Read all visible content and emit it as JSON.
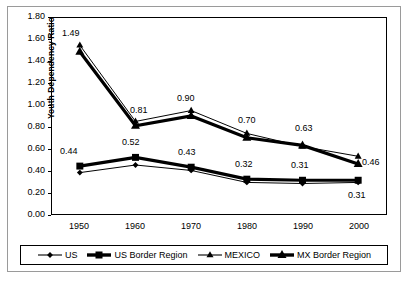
{
  "chart_data": {
    "type": "line",
    "title": "",
    "xlabel": "",
    "ylabel": "Youth Dependency Ratio",
    "categories": [
      "1950",
      "1960",
      "1970",
      "1980",
      "1990",
      "2000"
    ],
    "x": [
      1950,
      1960,
      1970,
      1980,
      1990,
      2000
    ],
    "ylim": [
      0.0,
      1.8
    ],
    "ytick_step": 0.2,
    "grid": false,
    "legend_position": "bottom",
    "series": [
      {
        "name": "US",
        "marker": "diamond",
        "line": "thin",
        "values": [
          0.38,
          0.45,
          0.4,
          0.29,
          0.28,
          0.29
        ]
      },
      {
        "name": "US Border Region",
        "marker": "square",
        "line": "thick",
        "values": [
          0.44,
          0.52,
          0.43,
          0.32,
          0.31,
          0.31
        ]
      },
      {
        "name": "MEXICO",
        "marker": "triangle",
        "line": "thin",
        "values": [
          1.55,
          0.85,
          0.95,
          0.74,
          0.62,
          0.53
        ]
      },
      {
        "name": "MX Border Region",
        "marker": "triangle",
        "line": "thick",
        "values": [
          1.49,
          0.81,
          0.9,
          0.7,
          0.63,
          0.46
        ]
      }
    ],
    "ytick_labels": [
      "1.80",
      "1.60",
      "1.40",
      "1.20",
      "1.00",
      "0.80",
      "0.60",
      "0.40",
      "0.20",
      "0.00"
    ],
    "ytick_values": [
      1.8,
      1.6,
      1.4,
      1.2,
      1.0,
      0.8,
      0.6,
      0.4,
      0.2,
      0.0
    ],
    "data_labels": [
      {
        "text": "1.49",
        "x": 1950,
        "value": 1.49,
        "series": "MX Border Region"
      },
      {
        "text": "0.81",
        "x": 1960,
        "value": 0.81,
        "series": "MX Border Region"
      },
      {
        "text": "0.90",
        "x": 1970,
        "value": 0.9,
        "series": "MX Border Region"
      },
      {
        "text": "0.70",
        "x": 1980,
        "value": 0.7,
        "series": "MX Border Region"
      },
      {
        "text": "0.63",
        "x": 1990,
        "value": 0.63,
        "series": "MX Border Region"
      },
      {
        "text": "0.46",
        "x": 2000,
        "value": 0.46,
        "series": "MX Border Region"
      },
      {
        "text": "0.44",
        "x": 1950,
        "value": 0.44,
        "series": "US Border Region"
      },
      {
        "text": "0.52",
        "x": 1960,
        "value": 0.52,
        "series": "US Border Region"
      },
      {
        "text": "0.43",
        "x": 1970,
        "value": 0.43,
        "series": "US Border Region"
      },
      {
        "text": "0.32",
        "x": 1980,
        "value": 0.32,
        "series": "US Border Region"
      },
      {
        "text": "0.31",
        "x": 1990,
        "value": 0.31,
        "series": "US Border Region"
      },
      {
        "text": "0.31",
        "x": 2000,
        "value": 0.31,
        "series": "US Border Region"
      }
    ],
    "colors": {
      "line": "#000000",
      "marker": "#000000",
      "axis": "#000000",
      "text": "#000000",
      "background": "#ffffff",
      "frame": "#9a9a9a"
    }
  },
  "legend": {
    "items": [
      {
        "label": "US",
        "marker": "diamond"
      },
      {
        "label": "US Border Region",
        "marker": "square"
      },
      {
        "label": "MEXICO",
        "marker": "triangle"
      },
      {
        "label": "MX Border Region",
        "marker": "triangle"
      }
    ]
  }
}
